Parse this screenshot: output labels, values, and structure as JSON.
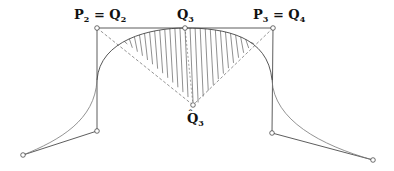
{
  "diagram": {
    "labels": {
      "p2_q2": {
        "main": "P",
        "sub1": "2",
        "eq": " = ",
        "main2": "Q",
        "sub2": "2"
      },
      "q3": {
        "main": "Q",
        "sub": "3"
      },
      "p3_q4": {
        "main": "P",
        "sub1": "3",
        "eq": " = ",
        "main2": "Q",
        "sub2": "4"
      },
      "q3_hat": {
        "main": "Q",
        "hat": "ˆ",
        "sub": "3"
      }
    },
    "colors": {
      "stroke": "#333333",
      "curve": "#555555",
      "hatch": "#444444",
      "dashed": "#666666"
    },
    "hatch_count": 34
  }
}
